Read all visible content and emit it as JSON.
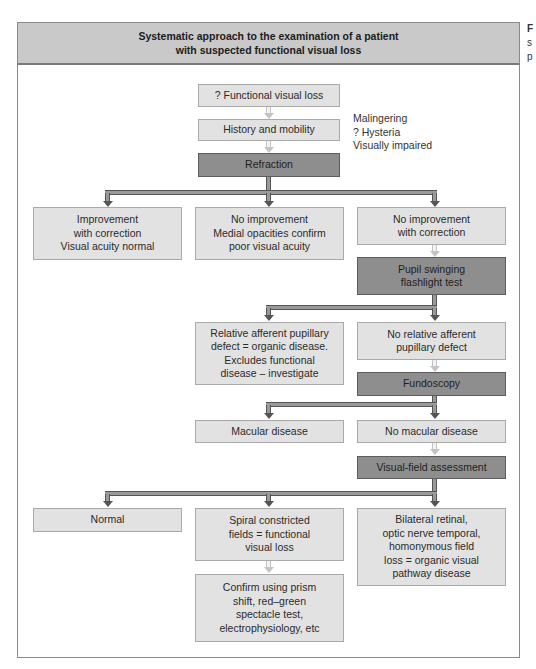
{
  "header": {
    "line1": "Systematic approach to the examination of a patient",
    "line2": "with suspected functional visual loss"
  },
  "side_caption": {
    "line1": "F",
    "line2": "s",
    "line3": "p"
  },
  "nodes": {
    "functional_visual_loss": "? Functional visual loss",
    "history_mobility": "History and mobility",
    "refraction": "Refraction",
    "improvement": [
      "Improvement",
      "with correction",
      "Visual acuity normal"
    ],
    "no_improvement_medial": [
      "No improvement",
      "Medial opacities confirm",
      "poor visual acuity"
    ],
    "no_improvement_correction": [
      "No improvement",
      "with correction"
    ],
    "pupil_swinging": [
      "Pupil swinging",
      "flashlight test"
    ],
    "relative_afferent": [
      "Relative afferent pupillary",
      "defect = organic disease.",
      "Excludes functional",
      "disease – investigate"
    ],
    "no_relative_afferent": [
      "No relative afferent",
      "pupillary defect"
    ],
    "fundoscopy": "Fundoscopy",
    "macular_disease": "Macular disease",
    "no_macular_disease": "No macular disease",
    "visual_field": "Visual-field assessment",
    "normal": "Normal",
    "spiral_constricted": [
      "Spiral constricted",
      "fields = functional",
      "visual loss"
    ],
    "bilateral_retinal": [
      "Bilateral retinal,",
      "optic nerve temporal,",
      "homonymous field",
      "loss = organic visual",
      "pathway disease"
    ],
    "confirm": [
      "Confirm using prism",
      "shift, red–green",
      "spectacle test,",
      "electrophysiology, etc"
    ]
  },
  "side_note": [
    "Malingering",
    "? Hysteria",
    "Visually impaired"
  ],
  "colors": {
    "header_bg": "#c9c9c9",
    "box_light": "#e2e2e2",
    "box_dark": "#8e8e8e",
    "frame_border": "#8a8a8a"
  }
}
